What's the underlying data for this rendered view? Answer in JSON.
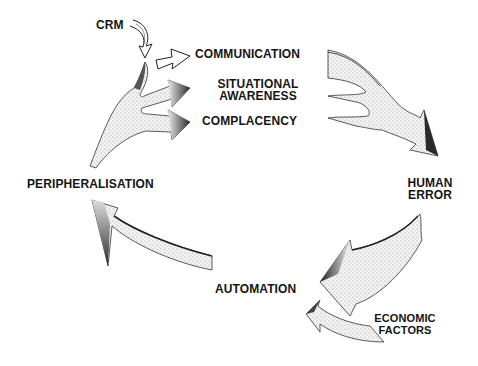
{
  "diagram": {
    "type": "cycle",
    "nodes": {
      "crm": "CRM",
      "communication": "COMMUNICATION",
      "situational_awareness_1": "SITUATIONAL",
      "situational_awareness_2": "AWARENESS",
      "complacency": "COMPLACENCY",
      "human_error_1": "HUMAN",
      "human_error_2": "ERROR",
      "automation": "AUTOMATION",
      "economic_factors_1": "ECONOMIC",
      "economic_factors_2": "FACTORS",
      "peripheralisation": "PERIPHERALISATION"
    },
    "edges": [
      {
        "from": "CRM",
        "to": "COMMUNICATION"
      },
      {
        "from": "PERIPHERALISATION",
        "to": "SITUATIONAL AWARENESS"
      },
      {
        "from": "PERIPHERALISATION",
        "to": "COMPLACENCY"
      },
      {
        "from": "COMMUNICATION / SITUATIONAL AWARENESS / COMPLACENCY",
        "to": "HUMAN ERROR"
      },
      {
        "from": "HUMAN ERROR",
        "to": "AUTOMATION"
      },
      {
        "from": "ECONOMIC FACTORS",
        "to": "AUTOMATION"
      },
      {
        "from": "AUTOMATION",
        "to": "PERIPHERALISATION"
      }
    ],
    "colors": {
      "ink": "#151515",
      "arrow_fill": "#e9e9e9",
      "arrow_shade": "#2a2a2a"
    }
  }
}
